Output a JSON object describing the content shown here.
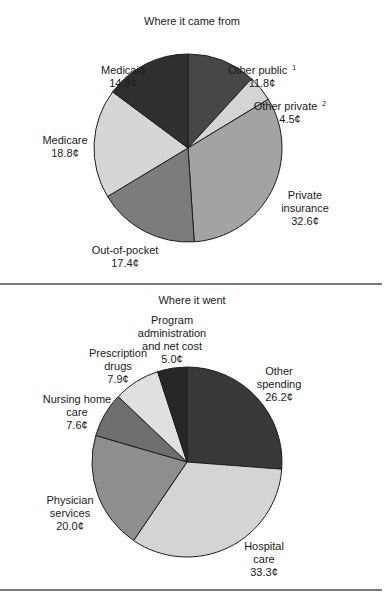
{
  "chart_data": [
    {
      "type": "pie",
      "title": "Where it came from",
      "unit": "¢",
      "start_angle_deg": 0,
      "direction": "clockwise",
      "center": [
        188,
        148
      ],
      "radius": 94,
      "slices": [
        {
          "name": "Other public",
          "footnote": "1",
          "value": 11.8,
          "value_label": "11.8¢",
          "color": "#474747",
          "label_pos": [
            262,
            64
          ],
          "lines": [
            "Other public",
            "11.8¢"
          ]
        },
        {
          "name": "Other private",
          "footnote": "2",
          "value": 4.5,
          "value_label": "4.5¢",
          "color": "#d4d4d4",
          "label_pos": [
            290,
            100
          ],
          "lines": [
            "Other private",
            "4.5¢"
          ]
        },
        {
          "name": "Private insurance",
          "value": 32.6,
          "value_label": "32.6¢",
          "color": "#a3a3a3",
          "label_pos": [
            305,
            189
          ],
          "lines": [
            "Private",
            "insurance",
            "32.6¢"
          ]
        },
        {
          "name": "Out-of-pocket",
          "value": 17.4,
          "value_label": "17.4¢",
          "color": "#7c7c7c",
          "label_pos": [
            125,
            244
          ],
          "lines": [
            "Out-of-pocket",
            "17.4¢"
          ]
        },
        {
          "name": "Medicare",
          "value": 18.8,
          "value_label": "18.8¢",
          "color": "#d6d6d6",
          "label_pos": [
            65,
            134
          ],
          "lines": [
            "Medicare",
            "18.8¢"
          ]
        },
        {
          "name": "Medicaid",
          "value": 14.8,
          "value_label": "14.8¢",
          "color": "#2f2f2f",
          "label_pos": [
            123,
            64
          ],
          "lines": [
            "Medicaid",
            "14.8¢"
          ]
        }
      ]
    },
    {
      "type": "pie",
      "title": "Where it went",
      "unit": "¢",
      "start_angle_deg": 0,
      "direction": "clockwise",
      "center": [
        187,
        462
      ],
      "radius": 95,
      "slices": [
        {
          "name": "Other spending",
          "value": 26.2,
          "value_label": "26.2¢",
          "color": "#383838",
          "label_pos": [
            279,
            365
          ],
          "lines": [
            "Other",
            "spending",
            "26.2¢"
          ]
        },
        {
          "name": "Hospital care",
          "value": 33.3,
          "value_label": "33.3¢",
          "color": "#d4d4d4",
          "label_pos": [
            264,
            540
          ],
          "lines": [
            "Hospital",
            "care",
            "33.3¢"
          ]
        },
        {
          "name": "Physician services",
          "value": 20.0,
          "value_label": "20.0¢",
          "color": "#8e8e8e",
          "label_pos": [
            70,
            494
          ],
          "lines": [
            "Physician",
            "services",
            "20.0¢"
          ]
        },
        {
          "name": "Nursing home care",
          "value": 7.6,
          "value_label": "7.6¢",
          "color": "#6e6e6e",
          "label_pos": [
            77,
            393
          ],
          "lines": [
            "Nursing home",
            "care",
            "7.6¢"
          ]
        },
        {
          "name": "Prescription drugs",
          "value": 7.9,
          "value_label": "7.9¢",
          "color": "#e0e0e0",
          "label_pos": [
            118,
            347
          ],
          "lines": [
            "Prescription",
            "drugs",
            "7.9¢"
          ]
        },
        {
          "name": "Program administration and net cost",
          "value": 5.0,
          "value_label": "5.0¢",
          "color": "#262626",
          "label_pos": [
            172,
            314
          ],
          "lines": [
            "Program",
            "administration",
            "and net cost",
            "5.0¢"
          ]
        }
      ]
    }
  ],
  "titles": {
    "top": "Where it came from",
    "bottom": "Where it went"
  }
}
